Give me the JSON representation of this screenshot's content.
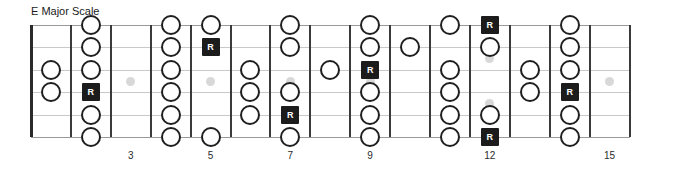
{
  "diagram": {
    "title": "E Major Scale",
    "type": "guitar-fretboard",
    "instrument": "guitar",
    "string_count": 6,
    "fret_count": 15,
    "root_label": "R",
    "colors": {
      "note_outline": "#1f1f1f",
      "root_fill": "#1c1c1c",
      "root_text": "#ffffff",
      "fret_line": "#3a3a3a",
      "nut": "#2b2b2b",
      "string_line": "#c9c9c9",
      "marker_dot": "#d8d8d8",
      "background": "#ffffff",
      "text": "#1a1a1a"
    },
    "fret_numbers": [
      {
        "fret": 3,
        "label": "3"
      },
      {
        "fret": 5,
        "label": "5"
      },
      {
        "fret": 7,
        "label": "7"
      },
      {
        "fret": 9,
        "label": "9"
      },
      {
        "fret": 12,
        "label": "12"
      },
      {
        "fret": 15,
        "label": "15"
      }
    ],
    "inlay_markers": [
      {
        "fret": 3,
        "count": 1
      },
      {
        "fret": 5,
        "count": 1
      },
      {
        "fret": 7,
        "count": 1
      },
      {
        "fret": 9,
        "count": 1
      },
      {
        "fret": 12,
        "count": 2
      },
      {
        "fret": 15,
        "count": 1
      }
    ],
    "notes": [
      {
        "fret": 1,
        "string": 3,
        "type": "circle",
        "label": ""
      },
      {
        "fret": 1,
        "string": 4,
        "type": "circle",
        "label": ""
      },
      {
        "fret": 2,
        "string": 1,
        "type": "circle",
        "label": ""
      },
      {
        "fret": 2,
        "string": 2,
        "type": "circle",
        "label": ""
      },
      {
        "fret": 2,
        "string": 3,
        "type": "circle",
        "label": ""
      },
      {
        "fret": 2,
        "string": 4,
        "type": "root",
        "label": "R"
      },
      {
        "fret": 2,
        "string": 5,
        "type": "circle",
        "label": ""
      },
      {
        "fret": 2,
        "string": 6,
        "type": "circle",
        "label": ""
      },
      {
        "fret": 4,
        "string": 1,
        "type": "circle",
        "label": ""
      },
      {
        "fret": 4,
        "string": 2,
        "type": "circle",
        "label": ""
      },
      {
        "fret": 4,
        "string": 3,
        "type": "circle",
        "label": ""
      },
      {
        "fret": 4,
        "string": 4,
        "type": "circle",
        "label": ""
      },
      {
        "fret": 4,
        "string": 5,
        "type": "circle",
        "label": ""
      },
      {
        "fret": 4,
        "string": 6,
        "type": "circle",
        "label": ""
      },
      {
        "fret": 5,
        "string": 1,
        "type": "circle",
        "label": ""
      },
      {
        "fret": 5,
        "string": 2,
        "type": "root",
        "label": "R"
      },
      {
        "fret": 5,
        "string": 6,
        "type": "circle",
        "label": ""
      },
      {
        "fret": 6,
        "string": 3,
        "type": "circle",
        "label": ""
      },
      {
        "fret": 6,
        "string": 4,
        "type": "circle",
        "label": ""
      },
      {
        "fret": 6,
        "string": 5,
        "type": "circle",
        "label": ""
      },
      {
        "fret": 7,
        "string": 1,
        "type": "circle",
        "label": ""
      },
      {
        "fret": 7,
        "string": 2,
        "type": "circle",
        "label": ""
      },
      {
        "fret": 7,
        "string": 4,
        "type": "circle",
        "label": ""
      },
      {
        "fret": 7,
        "string": 5,
        "type": "root",
        "label": "R"
      },
      {
        "fret": 7,
        "string": 6,
        "type": "circle",
        "label": ""
      },
      {
        "fret": 8,
        "string": 3,
        "type": "circle",
        "label": ""
      },
      {
        "fret": 9,
        "string": 1,
        "type": "circle",
        "label": ""
      },
      {
        "fret": 9,
        "string": 2,
        "type": "circle",
        "label": ""
      },
      {
        "fret": 9,
        "string": 3,
        "type": "root",
        "label": "R"
      },
      {
        "fret": 9,
        "string": 4,
        "type": "circle",
        "label": ""
      },
      {
        "fret": 9,
        "string": 5,
        "type": "circle",
        "label": ""
      },
      {
        "fret": 9,
        "string": 6,
        "type": "circle",
        "label": ""
      },
      {
        "fret": 10,
        "string": 2,
        "type": "circle",
        "label": ""
      },
      {
        "fret": 11,
        "string": 1,
        "type": "circle",
        "label": ""
      },
      {
        "fret": 11,
        "string": 3,
        "type": "circle",
        "label": ""
      },
      {
        "fret": 11,
        "string": 4,
        "type": "circle",
        "label": ""
      },
      {
        "fret": 11,
        "string": 5,
        "type": "circle",
        "label": ""
      },
      {
        "fret": 11,
        "string": 6,
        "type": "circle",
        "label": ""
      },
      {
        "fret": 12,
        "string": 1,
        "type": "root",
        "label": "R"
      },
      {
        "fret": 12,
        "string": 2,
        "type": "circle",
        "label": ""
      },
      {
        "fret": 12,
        "string": 5,
        "type": "circle",
        "label": ""
      },
      {
        "fret": 12,
        "string": 6,
        "type": "root",
        "label": "R"
      },
      {
        "fret": 13,
        "string": 3,
        "type": "circle",
        "label": ""
      },
      {
        "fret": 13,
        "string": 4,
        "type": "circle",
        "label": ""
      },
      {
        "fret": 14,
        "string": 1,
        "type": "circle",
        "label": ""
      },
      {
        "fret": 14,
        "string": 2,
        "type": "circle",
        "label": ""
      },
      {
        "fret": 14,
        "string": 3,
        "type": "circle",
        "label": ""
      },
      {
        "fret": 14,
        "string": 4,
        "type": "root",
        "label": "R"
      },
      {
        "fret": 14,
        "string": 5,
        "type": "circle",
        "label": ""
      },
      {
        "fret": 14,
        "string": 6,
        "type": "circle",
        "label": ""
      }
    ]
  }
}
